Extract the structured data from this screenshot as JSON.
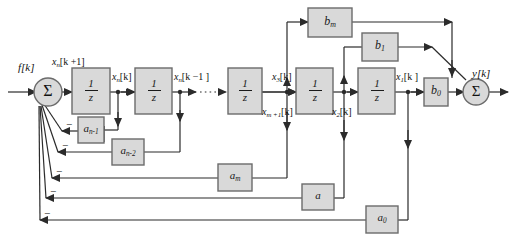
{
  "diagram": {
    "type": "signal-flow-block-diagram",
    "colors": {
      "box_fill": "#d9d9d9",
      "box_stroke": "#6b6b6b",
      "line": "#2b2b2b",
      "background": "#ffffff",
      "text": "#111111"
    },
    "signals": {
      "input": "f[k]",
      "output": "y[k]",
      "state_xn_next": {
        "base": "x",
        "sub": "n",
        "bracket": "[k +1]"
      },
      "state_xn": {
        "base": "x",
        "sub": "n",
        "bracket": "[k]"
      },
      "state_xn_prev": {
        "base": "x",
        "sub": "n",
        "bracket": "[k −1 ]"
      },
      "state_x3": {
        "base": "x",
        "sub": "3",
        "bracket": "[k]"
      },
      "state_xm1": {
        "base": "x",
        "sub": "m +1",
        "bracket": "[k]"
      },
      "state_x2": {
        "base": "x",
        "sub": "2",
        "bracket": "[k]"
      },
      "state_x1": {
        "base": "x",
        "sub": "1",
        "bracket": "[k ]"
      }
    },
    "delay_blocks": [
      {
        "name": "delay-1",
        "numerator": "1",
        "denominator": "z"
      },
      {
        "name": "delay-2",
        "numerator": "1",
        "denominator": "z"
      },
      {
        "name": "delay-3",
        "numerator": "1",
        "denominator": "z"
      },
      {
        "name": "delay-4",
        "numerator": "1",
        "denominator": "z"
      },
      {
        "name": "delay-5",
        "numerator": "1",
        "denominator": "z"
      }
    ],
    "feedforward_gains": [
      {
        "name": "gain-bm",
        "base": "b",
        "sub": "m"
      },
      {
        "name": "gain-b1",
        "base": "b",
        "sub": "1"
      },
      {
        "name": "gain-b0",
        "base": "b",
        "sub": "0"
      }
    ],
    "feedback_gains": [
      {
        "name": "gain-an-1",
        "base": "a",
        "sub": "n-1"
      },
      {
        "name": "gain-an-2",
        "base": "a",
        "sub": "n-2"
      },
      {
        "name": "gain-am",
        "base": "a",
        "sub": "m"
      },
      {
        "name": "gain-a",
        "base": "a",
        "sub": ""
      },
      {
        "name": "gain-a0",
        "base": "a",
        "sub": "0"
      }
    ],
    "summers": [
      {
        "name": "input-summer",
        "symbol": "Σ",
        "sign_count": 5,
        "sign": "−"
      },
      {
        "name": "output-summer",
        "symbol": "Σ"
      }
    ],
    "ellipsis": {
      "name": "dotted-continuation",
      "style": "dotted"
    }
  }
}
